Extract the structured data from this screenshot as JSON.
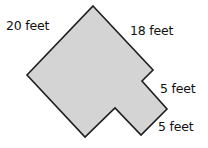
{
  "figure": {
    "fill_color": "#d4d4d4",
    "stroke_color": "#1e1e1e",
    "labels": {
      "top_left_side": "20 feet",
      "top_right_side": "18 feet",
      "notch_side": "5 feet",
      "bottom_right_side": "5 feet"
    },
    "dimensions_feet": {
      "long_side": 20,
      "top_right_side": 18,
      "notch_side": 5,
      "bottom_right_side": 5
    }
  }
}
